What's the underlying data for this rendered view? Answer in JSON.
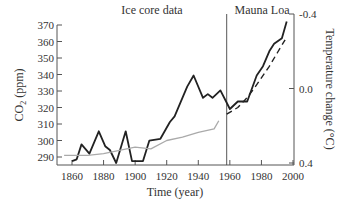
{
  "chart_data": {
    "type": "line",
    "title": "",
    "annotations": [
      "Ice core data",
      "Mauna Loa"
    ],
    "xlabel": "Time (year)",
    "ylabel": "CO2 (ppm)",
    "ylabel_right": "Temperature change (°C)",
    "xlim": [
      1855,
      2000
    ],
    "ylim": [
      287,
      370
    ],
    "ylim_right": [
      0.4,
      -0.4
    ],
    "x_ticks": [
      "1860",
      "1880",
      "1900",
      "1920",
      "1940",
      "1960",
      "1980",
      "2000"
    ],
    "y_ticks": [
      "290",
      "300",
      "310",
      "320",
      "330",
      "340",
      "350",
      "360",
      "370"
    ],
    "y_ticks_right": [
      "-0.4",
      "0.0",
      "0.4"
    ],
    "divider_year": 1958,
    "grid": false,
    "series": [
      {
        "name": "Temperature change",
        "axis": "right",
        "style": "solid-black",
        "x": [
          1860,
          1863,
          1866,
          1871,
          1877,
          1881,
          1884,
          1888,
          1894,
          1898,
          1905,
          1909,
          1916,
          1922,
          1925,
          1933,
          1937,
          1943,
          1946,
          1949,
          1954,
          1960,
          1965,
          1971,
          1977,
          1981,
          1985,
          1988,
          1993,
          1996
        ],
        "values": [
          0.39,
          0.38,
          0.3,
          0.35,
          0.23,
          0.31,
          0.33,
          0.4,
          0.23,
          0.39,
          0.39,
          0.28,
          0.27,
          0.18,
          0.15,
          -0.01,
          -0.07,
          0.05,
          0.03,
          0.05,
          0.01,
          0.11,
          0.07,
          0.07,
          -0.07,
          -0.12,
          -0.2,
          -0.24,
          -0.27,
          -0.36
        ]
      },
      {
        "name": "CO2 ice core",
        "axis": "left",
        "style": "solid-grey",
        "x": [
          1855,
          1870,
          1880,
          1890,
          1900,
          1910,
          1920,
          1930,
          1940,
          1950,
          1953
        ],
        "values": [
          291,
          291,
          292,
          294,
          296,
          295,
          300,
          302,
          305,
          307,
          312
        ]
      },
      {
        "name": "CO2 Mauna Loa",
        "axis": "left",
        "style": "dashed-black",
        "x": [
          1958,
          1965,
          1970,
          1975,
          1980,
          1985,
          1990,
          1995
        ],
        "values": [
          316,
          320,
          325,
          331,
          338,
          345,
          353,
          361
        ]
      }
    ]
  }
}
